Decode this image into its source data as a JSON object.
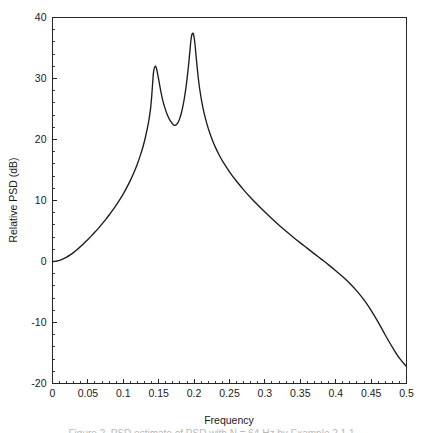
{
  "figure": {
    "background_color": "#ffffff",
    "curve_color": "#1c1c1c",
    "axis_color": "#262626"
  },
  "caption": {
    "text": "Figure 2.  PSD estimate of PSD with N = 64 Hz by Example 2.1.1",
    "visible_fragment": "clipped"
  },
  "chart_data": {
    "type": "line",
    "title": "",
    "xlabel": "Frequency",
    "ylabel": "Relative PSD  (dB)",
    "xlim": [
      0,
      0.5
    ],
    "ylim": [
      -20,
      40
    ],
    "grid": false,
    "legend": null,
    "xticks": [
      0,
      0.05,
      0.1,
      0.15,
      0.2,
      0.25,
      0.3,
      0.35,
      0.4,
      0.45,
      0.5
    ],
    "xticklabels": [
      "0",
      "0.05",
      "0.1",
      "0.15",
      "0.2",
      "0.25",
      "0.3",
      "0.35",
      "0.4",
      "0.45",
      "0.5"
    ],
    "x_minor_tick_step": 0.01,
    "yticks": [
      -20,
      -10,
      0,
      10,
      20,
      30,
      40
    ],
    "yticklabels": [
      "-20",
      "-10",
      "0",
      "10",
      "20",
      "30",
      "40"
    ],
    "y_minor_tick_step": 2,
    "annotations": [
      {
        "label": "peak-1",
        "x": 0.14,
        "y": 32.0
      },
      {
        "label": "valley",
        "x": 0.17,
        "y": 22.3
      },
      {
        "label": "peak-2",
        "x": 0.198,
        "y": 37.4
      },
      {
        "label": "left-endpoint",
        "x": 0.0,
        "y": 0.0
      },
      {
        "label": "right-endpoint",
        "x": 0.5,
        "y": -17.2
      }
    ],
    "series": [
      {
        "name": "Relative PSD",
        "color": "#1c1c1c",
        "x": [
          0.0,
          0.005,
          0.01,
          0.015,
          0.02,
          0.025,
          0.03,
          0.035,
          0.04,
          0.045,
          0.05,
          0.055,
          0.06,
          0.065,
          0.07,
          0.075,
          0.08,
          0.085,
          0.09,
          0.095,
          0.1,
          0.105,
          0.11,
          0.115,
          0.12,
          0.125,
          0.128,
          0.131,
          0.134,
          0.136,
          0.138,
          0.139,
          0.14,
          0.141,
          0.142,
          0.143,
          0.145,
          0.147,
          0.15,
          0.153,
          0.156,
          0.159,
          0.162,
          0.165,
          0.168,
          0.17,
          0.172,
          0.174,
          0.176,
          0.178,
          0.18,
          0.182,
          0.184,
          0.186,
          0.188,
          0.19,
          0.192,
          0.194,
          0.195,
          0.196,
          0.197,
          0.198,
          0.199,
          0.2,
          0.201,
          0.202,
          0.204,
          0.206,
          0.208,
          0.211,
          0.214,
          0.218,
          0.222,
          0.226,
          0.23,
          0.235,
          0.24,
          0.25,
          0.26,
          0.27,
          0.28,
          0.29,
          0.3,
          0.31,
          0.32,
          0.33,
          0.34,
          0.35,
          0.36,
          0.37,
          0.38,
          0.39,
          0.4,
          0.41,
          0.42,
          0.43,
          0.44,
          0.45,
          0.46,
          0.47,
          0.48,
          0.49,
          0.5
        ],
        "y": [
          0.0,
          0.05,
          0.2,
          0.42,
          0.72,
          1.08,
          1.5,
          1.97,
          2.48,
          3.03,
          3.6,
          4.2,
          4.83,
          5.48,
          6.16,
          6.87,
          7.62,
          8.41,
          9.25,
          10.14,
          11.1,
          12.15,
          13.3,
          14.58,
          16.03,
          17.72,
          18.9,
          20.25,
          21.85,
          23.05,
          24.6,
          25.6,
          26.9,
          28.5,
          30.1,
          31.3,
          32.0,
          31.6,
          29.8,
          27.9,
          26.3,
          25.1,
          24.1,
          23.35,
          22.8,
          22.5,
          22.32,
          22.35,
          22.55,
          22.95,
          23.55,
          24.35,
          25.35,
          26.6,
          28.1,
          29.9,
          32.0,
          34.4,
          35.7,
          36.7,
          37.25,
          37.42,
          37.3,
          36.8,
          35.9,
          34.7,
          32.2,
          30.0,
          28.2,
          26.1,
          24.4,
          22.6,
          21.1,
          19.85,
          18.75,
          17.55,
          16.5,
          14.7,
          13.15,
          11.75,
          10.45,
          9.25,
          8.1,
          7.0,
          5.95,
          4.95,
          3.98,
          3.05,
          2.15,
          1.25,
          0.35,
          -0.55,
          -1.5,
          -2.5,
          -3.6,
          -4.85,
          -6.3,
          -8.0,
          -9.95,
          -12.05,
          -14.05,
          -15.85,
          -17.2
        ]
      }
    ]
  }
}
